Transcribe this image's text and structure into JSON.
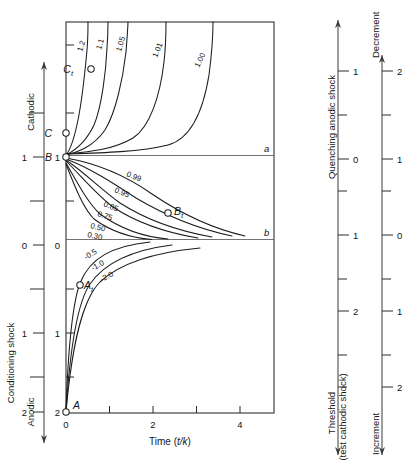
{
  "figure": {
    "type": "contour",
    "x_axis": {
      "label": "Time (t/k)",
      "ticks": [
        {
          "value": 0,
          "label": "0"
        },
        {
          "value": 1,
          "label": ""
        },
        {
          "value": 2,
          "label": "2"
        },
        {
          "value": 3,
          "label": ""
        },
        {
          "value": 4,
          "label": "4"
        },
        {
          "value": 5,
          "label": ""
        }
      ],
      "range": [
        0,
        4.9
      ]
    },
    "y_axis_inner": {
      "ticks": [
        {
          "value": 1.0,
          "label": "1"
        },
        {
          "value": 0.5,
          "label": ""
        },
        {
          "value": 0.0,
          "label": "0"
        },
        {
          "value": -0.5,
          "label": ""
        },
        {
          "value": -1.0,
          "label": "1"
        },
        {
          "value": -1.5,
          "label": ""
        },
        {
          "value": -2.0,
          "label": "2"
        }
      ],
      "range": [
        1.55,
        -2.0
      ]
    },
    "y_axis_outer": {
      "title": "Conditioning shock",
      "arrow_top_label": "Cathodic",
      "arrow_bottom_label": "Anodic",
      "ticks": [
        {
          "value": 1.5,
          "label": ""
        },
        {
          "value": 1.0,
          "label": "1"
        },
        {
          "value": 0.5,
          "label": ""
        },
        {
          "value": 0.0,
          "label": "0"
        },
        {
          "value": -0.5,
          "label": ""
        },
        {
          "value": -1.0,
          "label": "1"
        },
        {
          "value": -1.5,
          "label": ""
        },
        {
          "value": -2.0,
          "label": "2"
        }
      ]
    },
    "right_axis_1": {
      "title_top": "Quenching anodic shock",
      "title_bottom": "Threshold\n(test cathodic shock)",
      "title_bottom_line1": "Threshold",
      "title_bottom_line2": "(test cathodic shock)",
      "ticks": [
        {
          "value": 1.0,
          "label": "1"
        },
        {
          "value": 0.5,
          "label": ""
        },
        {
          "value": 0.0,
          "label": "0"
        },
        {
          "value": -0.5,
          "label": ""
        },
        {
          "value": -1.0,
          "label": "1"
        },
        {
          "value": -1.5,
          "label": ""
        },
        {
          "value": -2.0,
          "label": "2"
        },
        {
          "value": -2.5,
          "label": ""
        }
      ]
    },
    "right_axis_2": {
      "title_top": "Decrement",
      "title_bottom": "Increment",
      "ticks": [
        {
          "value": 2.0,
          "label": "2"
        },
        {
          "value": 1.5,
          "label": ""
        },
        {
          "value": 1.0,
          "label": "1"
        },
        {
          "value": 0.5,
          "label": ""
        },
        {
          "value": 0.0,
          "label": "0"
        },
        {
          "value": -0.5,
          "label": ""
        },
        {
          "value": -1.0,
          "label": "1"
        },
        {
          "value": -1.5,
          "label": ""
        },
        {
          "value": -2.0,
          "label": "2"
        }
      ]
    },
    "contours_upper": [
      {
        "label": "1.2",
        "label_x": 84,
        "label_y": 46
      },
      {
        "label": "1.1",
        "label_x": 103,
        "label_y": 44
      },
      {
        "label": "1.05",
        "label_x": 122,
        "label_y": 44
      },
      {
        "label": "1.01",
        "label_x": 156,
        "label_y": 48
      },
      {
        "label": "1.00",
        "label_x": 196,
        "label_y": 56
      }
    ],
    "contours_lower": [
      {
        "label": "0.99",
        "label_x": 128,
        "label_y": 172
      },
      {
        "label": "0.95",
        "label_x": 118,
        "label_y": 188
      },
      {
        "label": "0.85",
        "label_x": 108,
        "label_y": 202
      },
      {
        "label": "0.75",
        "label_x": 103,
        "label_y": 211
      },
      {
        "label": "0.50",
        "label_x": 96,
        "label_y": 224
      },
      {
        "label": "0.30",
        "label_x": 93,
        "label_y": 233
      },
      {
        "label": "-0.5",
        "label_x": 92,
        "label_y": 256
      },
      {
        "label": "-1.0",
        "label_x": 98,
        "label_y": 266
      },
      {
        "label": "-2.0",
        "label_x": 106,
        "label_y": 277
      }
    ],
    "points": [
      {
        "name": "A",
        "label": "A",
        "x": 66,
        "y": 412,
        "label_x": 73,
        "label_y": 407
      },
      {
        "name": "B",
        "label": "B",
        "x": 66,
        "y": 157,
        "label_x": 51,
        "label_y": 154
      },
      {
        "name": "C",
        "label": "C",
        "x": 66,
        "y": 133,
        "label_x": 51,
        "label_y": 130
      },
      {
        "name": "At",
        "label": "A",
        "sub": "t",
        "x": 79,
        "y": 284,
        "label_x": 83,
        "label_y": 281
      },
      {
        "name": "Bt",
        "label": "B",
        "sub": "t",
        "x": 168,
        "y": 212,
        "label_x": 173,
        "label_y": 209
      },
      {
        "name": "Ct",
        "label": "C",
        "sub": "t",
        "x": 90,
        "y": 69,
        "label_x": 74,
        "label_y": 65
      }
    ],
    "reference_lines": [
      {
        "label": "a",
        "y": 155,
        "x1": 66,
        "x2": 274,
        "label_x": 263,
        "label_y": 150
      },
      {
        "label": "b",
        "y": 239,
        "x1": 66,
        "x2": 274,
        "label_x": 263,
        "label_y": 234
      }
    ]
  },
  "colors": {
    "curve": "#1c1c1c",
    "frame": "#3a3a3a",
    "reference": "#5a5a5a",
    "text": "#141414",
    "background": "#ffffff"
  }
}
